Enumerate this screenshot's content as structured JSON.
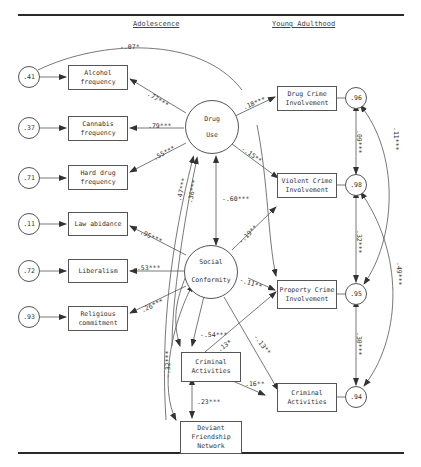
{
  "headers": {
    "left": "Adolescence",
    "right": "Young Adulthood"
  },
  "latent": {
    "drug_use": {
      "line1": "Drug",
      "line2": "Use"
    },
    "social_conformity": {
      "line1": "Social",
      "line2": "Conformity"
    }
  },
  "indicators": [
    {
      "id": "alcohol",
      "label": "Alcohol\nfrequency",
      "error": ".41",
      "loading": ".77***"
    },
    {
      "id": "cannabis",
      "label": "Cannabis\nfrequency",
      "error": ".37",
      "loading": ".79***"
    },
    {
      "id": "hard_drug",
      "label": "Hard drug\nfrequency",
      "error": ".71",
      "loading": ".55***"
    },
    {
      "id": "law",
      "label": "Law abidance",
      "error": ".11",
      "loading": ".95***"
    },
    {
      "id": "liberalism",
      "label": "Liberalism",
      "error": ".72",
      "loading": "-.53***"
    },
    {
      "id": "religious",
      "label": "Religious\ncommitment",
      "error": ".93",
      "loading": ".26***"
    }
  ],
  "adolescent_observed": {
    "criminal_activities": "Criminal\nActivities",
    "deviant_network": "Deviant\nFriendship\nNetwork"
  },
  "outcomes": [
    {
      "id": "drug_crime",
      "label": "Drug Crime\nInvolvement",
      "error": ".96"
    },
    {
      "id": "violent_crime",
      "label": "Violent Crime\nInvolvement",
      "error": ".98"
    },
    {
      "id": "property_crime",
      "label": "Property Crime\nInvolvement",
      "error": ".95"
    },
    {
      "id": "criminal_activities_ya",
      "label": "Criminal\nActivities",
      "error": ".94"
    }
  ],
  "paths": {
    "error41_to_drugcrime": "-.07*",
    "drug_to_drugcrime": ".18***",
    "drug_to_violent": "-.15**",
    "drug_social_cov": "-.60***",
    "social_to_violent": "-.19**",
    "social_to_property": "-.11**",
    "social_criminal_cov": "-.54***",
    "criminal_to_property": ".13*",
    "social_to_criminal_ya": "-.13**",
    "criminal_to_criminal_ya": ".16**",
    "criminal_deviant_cov": ".23***",
    "deviant_drug_cov": ".47***",
    "criminal_drug_cov": ".36***",
    "deviant_social_cov": "-.32***",
    "err96_98": ".09***",
    "err96_95": ".11***",
    "err98_95": ".32***",
    "err98_94": ".49***",
    "err95_94": ".30***"
  }
}
